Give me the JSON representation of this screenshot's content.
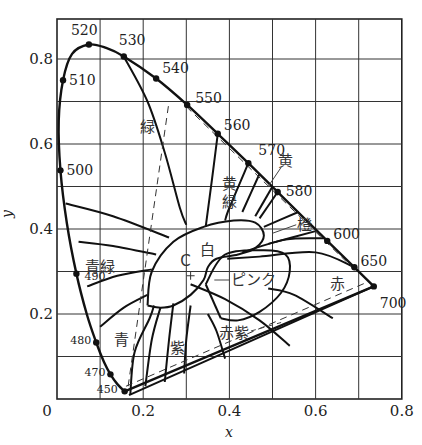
{
  "chart_data": {
    "type": "scatter",
    "title": "",
    "xlabel": "x",
    "ylabel": "y",
    "xlim": [
      0,
      0.8
    ],
    "ylim": [
      0,
      0.88
    ],
    "grid": true,
    "x_ticks": [
      "0",
      "0.2",
      "0.4",
      "0.6",
      "0.8"
    ],
    "y_ticks": [
      "0.2",
      "0.4",
      "0.6",
      "0.8"
    ],
    "spectral_locus": [
      {
        "nm": "450",
        "x": 0.157,
        "y": 0.018
      },
      {
        "nm": "470",
        "x": 0.124,
        "y": 0.058
      },
      {
        "nm": "480",
        "x": 0.091,
        "y": 0.133
      },
      {
        "nm": "490",
        "x": 0.045,
        "y": 0.295
      },
      {
        "nm": "500",
        "x": 0.008,
        "y": 0.538
      },
      {
        "nm": "510",
        "x": 0.014,
        "y": 0.75
      },
      {
        "nm": "520",
        "x": 0.074,
        "y": 0.834
      },
      {
        "nm": "530",
        "x": 0.155,
        "y": 0.806
      },
      {
        "nm": "540",
        "x": 0.23,
        "y": 0.754
      },
      {
        "nm": "550",
        "x": 0.302,
        "y": 0.692
      },
      {
        "nm": "560",
        "x": 0.373,
        "y": 0.624
      },
      {
        "nm": "570",
        "x": 0.444,
        "y": 0.555
      },
      {
        "nm": "580",
        "x": 0.512,
        "y": 0.487
      },
      {
        "nm": "600",
        "x": 0.627,
        "y": 0.372
      },
      {
        "nm": "650",
        "x": 0.69,
        "y": 0.31
      },
      {
        "nm": "700",
        "x": 0.735,
        "y": 0.265
      }
    ],
    "white_point": {
      "label": "C",
      "x": 0.31,
      "y": 0.316
    },
    "regions": [
      {
        "label": "緑",
        "x": 0.21,
        "y": 0.64
      },
      {
        "label": "黄緑",
        "x": 0.4,
        "y": 0.5
      },
      {
        "label": "黄",
        "x": 0.53,
        "y": 0.56
      },
      {
        "label": "橙",
        "x": 0.575,
        "y": 0.41
      },
      {
        "label": "白",
        "x": 0.35,
        "y": 0.35
      },
      {
        "label": "青緑",
        "x": 0.1,
        "y": 0.31
      },
      {
        "label": "ピンク",
        "x": 0.455,
        "y": 0.28
      },
      {
        "label": "赤",
        "x": 0.65,
        "y": 0.27
      },
      {
        "label": "青",
        "x": 0.15,
        "y": 0.14
      },
      {
        "label": "紫",
        "x": 0.28,
        "y": 0.12
      },
      {
        "label": "赤紫",
        "x": 0.41,
        "y": 0.155
      }
    ]
  }
}
